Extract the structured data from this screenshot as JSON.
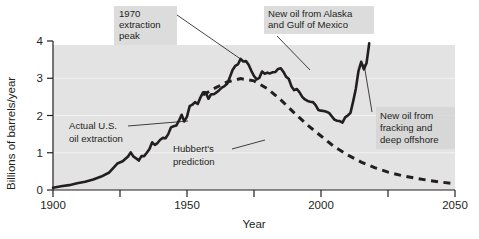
{
  "chart_data": {
    "type": "line",
    "title": "",
    "xlabel": "Year",
    "ylabel": "Billions of barrels/year",
    "xlim": [
      1900,
      2050
    ],
    "ylim": [
      0,
      4
    ],
    "xticks": [
      1900,
      1950,
      2000,
      2050
    ],
    "xtick_labels": [
      "1900",
      "1950",
      "2000",
      "2050"
    ],
    "xticks_minor": [
      1925,
      1975,
      2025
    ],
    "yticks": [
      0,
      1,
      2,
      3,
      4
    ],
    "ytick_labels": [
      "0",
      "1",
      "2",
      "3",
      "4"
    ],
    "grid": "horizontal-light",
    "legend": "none (inline annotations)",
    "series": [
      {
        "name": "Actual U.S. oil extraction",
        "style": "solid",
        "x": [
          1900,
          1903,
          1906,
          1909,
          1912,
          1915,
          1918,
          1921,
          1924,
          1926,
          1928,
          1929,
          1930,
          1931,
          1932,
          1933,
          1934,
          1935,
          1936,
          1937,
          1938,
          1939,
          1940,
          1941,
          1942,
          1943,
          1944,
          1945,
          1946,
          1947,
          1948,
          1949,
          1950,
          1951,
          1952,
          1953,
          1954,
          1955,
          1956,
          1957,
          1958,
          1959,
          1960,
          1961,
          1962,
          1963,
          1964,
          1965,
          1966,
          1967,
          1968,
          1969,
          1970,
          1971,
          1972,
          1973,
          1974,
          1975,
          1976,
          1977,
          1978,
          1979,
          1980,
          1981,
          1982,
          1983,
          1984,
          1985,
          1986,
          1987,
          1988,
          1989,
          1990,
          1991,
          1992,
          1993,
          1994,
          1995,
          1996,
          1997,
          1998,
          1999,
          2000,
          2001,
          2002,
          2003,
          2004,
          2005,
          2006,
          2007,
          2008,
          2009,
          2010,
          2011,
          2012,
          2013,
          2014,
          2015,
          2016,
          2017,
          2018
        ],
        "y": [
          0.06,
          0.1,
          0.13,
          0.18,
          0.22,
          0.28,
          0.36,
          0.47,
          0.71,
          0.77,
          0.9,
          1.01,
          0.9,
          0.85,
          0.79,
          0.91,
          0.91,
          1.0,
          1.1,
          1.28,
          1.21,
          1.26,
          1.35,
          1.4,
          1.39,
          1.5,
          1.68,
          1.71,
          1.73,
          1.86,
          2.02,
          1.84,
          1.97,
          2.25,
          2.29,
          2.36,
          2.31,
          2.48,
          2.62,
          2.62,
          2.45,
          2.57,
          2.57,
          2.62,
          2.68,
          2.75,
          2.79,
          2.85,
          3.03,
          3.22,
          3.33,
          3.37,
          3.52,
          3.45,
          3.46,
          3.36,
          3.2,
          3.06,
          2.97,
          3.01,
          3.18,
          3.12,
          3.15,
          3.13,
          3.16,
          3.17,
          3.25,
          3.27,
          3.17,
          3.04,
          2.98,
          2.78,
          2.68,
          2.71,
          2.62,
          2.5,
          2.43,
          2.39,
          2.37,
          2.36,
          2.28,
          2.15,
          2.13,
          2.12,
          2.1,
          2.07,
          1.98,
          1.89,
          1.86,
          1.85,
          1.81,
          1.95,
          2.0,
          2.07,
          2.38,
          2.72,
          3.2,
          3.44,
          3.24,
          3.41,
          3.94
        ],
        "peak_year": 1970,
        "peak_value": 3.5
      },
      {
        "name": "Hubbert's prediction",
        "style": "dashed",
        "x": [
          1956,
          1960,
          1965,
          1970,
          1975,
          1980,
          1985,
          1990,
          1995,
          2000,
          2005,
          2010,
          2015,
          2020,
          2025,
          2030,
          2035,
          2040,
          2045,
          2050
        ],
        "y": [
          2.55,
          2.72,
          2.9,
          2.99,
          2.93,
          2.72,
          2.42,
          2.07,
          1.74,
          1.45,
          1.16,
          0.94,
          0.75,
          0.6,
          0.48,
          0.39,
          0.32,
          0.26,
          0.21,
          0.17
        ],
        "peak_year": 1970,
        "peak_value": 3.0
      }
    ],
    "annotations": [
      {
        "id": "peak-1970",
        "lines": [
          "1970",
          "extraction",
          "peak"
        ],
        "target_year": 1970,
        "target_value": 3.5
      },
      {
        "id": "alaska-gulf",
        "lines": [
          "New oil from Alaska",
          "and Gulf of Mexico"
        ],
        "target_year": 1985,
        "target_value": 3.25
      },
      {
        "id": "actual-extraction",
        "lines": [
          "Actual U.S.",
          "oil extraction"
        ],
        "target_year": 1949,
        "target_value": 1.97
      },
      {
        "id": "hubbert-prediction",
        "lines": [
          "Hubbert's",
          "prediction"
        ],
        "target_year": 2000,
        "target_value": 1.45
      },
      {
        "id": "fracking-offshore",
        "lines": [
          "New oil from",
          "fracking and",
          "deep offshore"
        ],
        "target_year": 2015,
        "target_value": 3.44
      }
    ],
    "colors": {
      "plot_background": "#e3e3e3",
      "series_line": "#231f20",
      "annotation_background": "#d4d4d4",
      "gridline": "#f2f2f2",
      "page_background": "#ffffff"
    }
  }
}
